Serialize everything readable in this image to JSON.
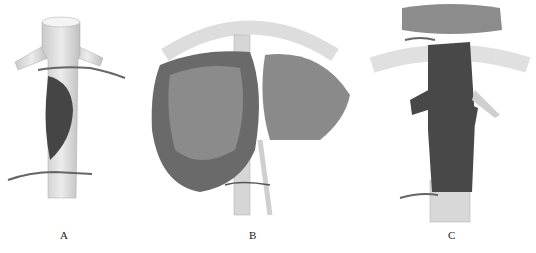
{
  "figure": {
    "panels": [
      {
        "id": "A",
        "label": "A",
        "depicts": "vessel-with-tumor-and-ligatures"
      },
      {
        "id": "B",
        "label": "B",
        "depicts": "liver-with-vascular-pedicle"
      },
      {
        "id": "C",
        "label": "C",
        "depicts": "vessel-encased-by-tumor-below-diaphragm"
      }
    ]
  },
  "colors": {
    "vessel": "#d9d9d9",
    "vessel_shade": "#bdbdbd",
    "tumor": "#4a4a4a",
    "liver": "#6e6e6e",
    "background": "#ffffff"
  }
}
